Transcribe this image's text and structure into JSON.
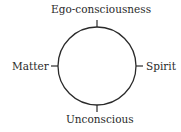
{
  "diagram": {
    "type": "circle-with-four-poles",
    "labels": {
      "top": "Ego-consciousness",
      "bottom": "Unconscious",
      "left": "Matter",
      "right": "Spirit"
    },
    "colors": {
      "stroke": "#2a2a2a",
      "text": "#2a2a2a",
      "background": "#ffffff"
    }
  }
}
